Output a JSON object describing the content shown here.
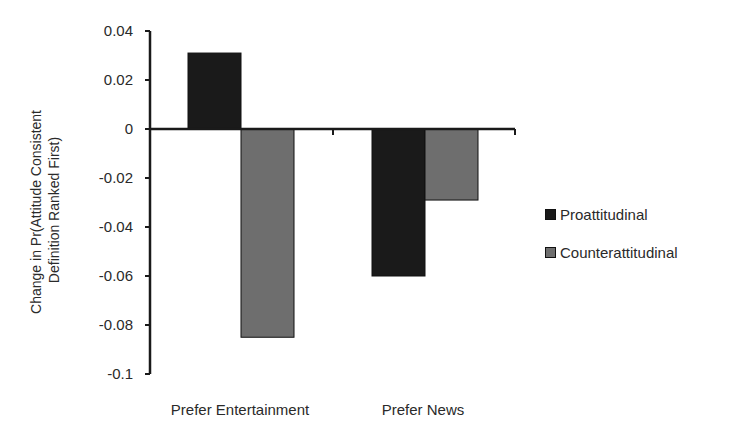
{
  "chart_data": {
    "type": "bar",
    "title": "",
    "xlabel": "",
    "ylabel": "Change in Pr(Attitude Consistent Definition Ranked First)",
    "ylabel_lines": [
      "Change in Pr(Attitude Consistent",
      "Definition Ranked First)"
    ],
    "categories": [
      "Prefer Entertainment",
      "Prefer News"
    ],
    "series": [
      {
        "name": "Proattitudinal",
        "color": "#1a1a1a",
        "values": [
          0.031,
          -0.06
        ]
      },
      {
        "name": "Counterattitudinal",
        "color": "#6e6e6e",
        "values": [
          -0.085,
          -0.029
        ]
      }
    ],
    "ylim": [
      -0.1,
      0.04
    ],
    "yticks": [
      0.04,
      0.02,
      0,
      -0.02,
      -0.04,
      -0.06,
      -0.08,
      -0.1
    ],
    "ytick_labels": [
      "0.04",
      "0.02",
      "0",
      "-0.02",
      "-0.04",
      "-0.06",
      "-0.08",
      "-0.1"
    ],
    "grid": false,
    "legend_position": "right"
  },
  "legend": {
    "items": [
      {
        "label": "Proattitudinal",
        "color": "#1a1a1a"
      },
      {
        "label": "Counterattitudinal",
        "color": "#6e6e6e"
      }
    ]
  }
}
